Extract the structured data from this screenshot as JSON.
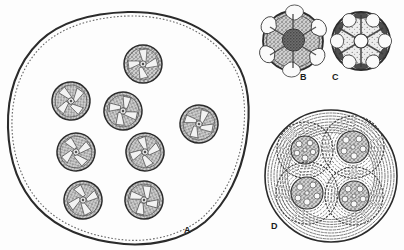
{
  "plate": {
    "kind": "scientific-illustration",
    "medium": "engraved line drawing / stipple",
    "subject": "microscopic spherical cells with radiate internal bodies",
    "background_color": "#fdfdfd",
    "ink_color": "#2b2b2b",
    "fill_light": "#e9e9e9",
    "fill_mid": "#a8a8a8",
    "fill_dark": "#5e5e5e",
    "fill_darkest": "#3d3d3d",
    "width": 404,
    "height": 250
  },
  "figures": [
    {
      "id": "A",
      "label": "A",
      "label_x": 184,
      "label_y": 226,
      "description": "large irregular hand-drawn circle (colony envelope) enclosing eight small radiate cells",
      "outline": {
        "cx": 128,
        "cy": 127,
        "rx": 120,
        "ry": 115
      },
      "inner_cell_count": 8,
      "inner_cells": [
        {
          "cx": 143,
          "cy": 64,
          "r": 19
        },
        {
          "cx": 199,
          "cy": 124,
          "r": 19
        },
        {
          "cx": 71,
          "cy": 101,
          "r": 19
        },
        {
          "cx": 123,
          "cy": 111,
          "r": 19
        },
        {
          "cx": 76,
          "cy": 152,
          "r": 19
        },
        {
          "cx": 145,
          "cy": 152,
          "r": 19
        },
        {
          "cx": 83,
          "cy": 200,
          "r": 19
        },
        {
          "cx": 144,
          "cy": 200,
          "r": 19
        }
      ]
    },
    {
      "id": "B",
      "label": "B",
      "label_x": 300,
      "label_y": 73,
      "description": "single cell, surface view, dark central pyrenoid with radiating arms and pale lobes",
      "outline": {
        "cx": 293,
        "cy": 41,
        "r": 30
      },
      "center_tone": "dark",
      "lobe_count": 6
    },
    {
      "id": "C",
      "label": "C",
      "label_x": 332,
      "label_y": 73,
      "description": "single cell, optical section, pale central vacuole with radiating arms and dark marginal wedges",
      "outline": {
        "cx": 361,
        "cy": 41,
        "r": 29
      },
      "center_tone": "light",
      "lobe_count": 6
    },
    {
      "id": "D",
      "label": "D",
      "label_x": 271,
      "label_y": 222,
      "description": "large circle with many concentric gelatinous lamellae enclosing four daughter cells, each also surrounded by concentric lamellae",
      "outline": {
        "cx": 331,
        "cy": 176,
        "r": 66
      },
      "outer_ring_count": 9,
      "daughter_count": 4,
      "daughters": [
        {
          "cx": 305,
          "cy": 150,
          "r": 28,
          "core_r": 14,
          "rings": 5
        },
        {
          "cx": 353,
          "cy": 147,
          "r": 31,
          "core_r": 16,
          "rings": 5
        },
        {
          "cx": 307,
          "cy": 193,
          "r": 31,
          "core_r": 16,
          "rings": 5
        },
        {
          "cx": 354,
          "cy": 196,
          "r": 29,
          "core_r": 15,
          "rings": 5
        }
      ]
    }
  ]
}
